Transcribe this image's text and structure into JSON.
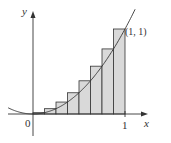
{
  "labels": {
    "y_axis": "y",
    "x_axis": "x",
    "origin": "0",
    "x_tick": "1",
    "point": "(1, 1)"
  },
  "diagram": {
    "curve": "y = x^2",
    "rectangles": 8,
    "interval": [
      0,
      1
    ],
    "rect_fill": "#d9d9d9",
    "stroke": "#333333"
  }
}
